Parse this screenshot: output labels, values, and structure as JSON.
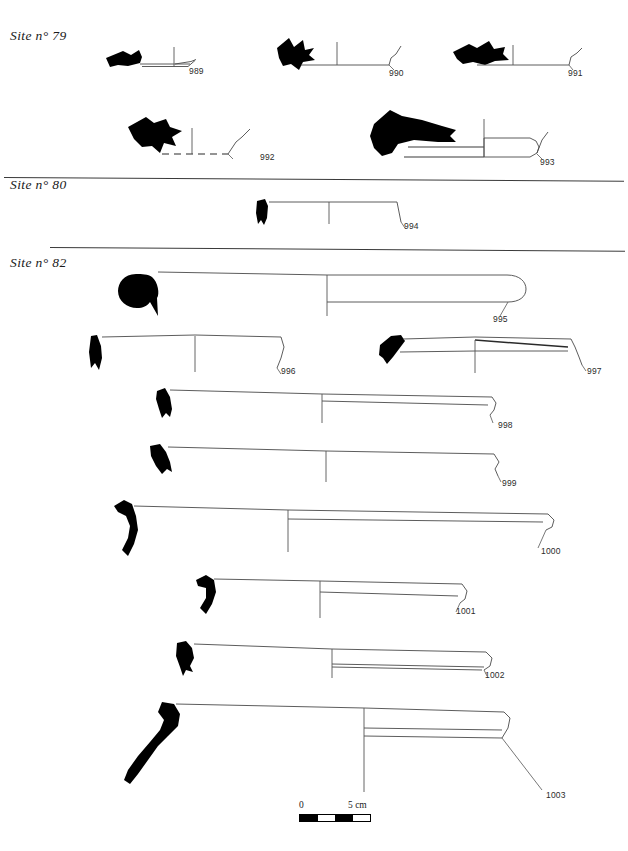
{
  "plate": {
    "type": "archaeological-pottery-plate",
    "width": 628,
    "height": 851,
    "page_header_left": "",
    "page_header_right": ""
  },
  "sections": [
    {
      "id": "site79",
      "label": "Site n° 79"
    },
    {
      "id": "site80",
      "label": "Site n° 80"
    },
    {
      "id": "site82",
      "label": "Site n° 82"
    }
  ],
  "figures": [
    {
      "number": "989",
      "site": "Site n° 79"
    },
    {
      "number": "990",
      "site": "Site n° 79"
    },
    {
      "number": "991",
      "site": "Site n° 79"
    },
    {
      "number": "992",
      "site": "Site n° 79"
    },
    {
      "number": "993",
      "site": "Site n° 79"
    },
    {
      "number": "994",
      "site": "Site n° 80"
    },
    {
      "number": "995",
      "site": "Site n° 82"
    },
    {
      "number": "996",
      "site": "Site n° 82"
    },
    {
      "number": "997",
      "site": "Site n° 82"
    },
    {
      "number": "998",
      "site": "Site n° 82"
    },
    {
      "number": "999",
      "site": "Site n° 82"
    },
    {
      "number": "1000",
      "site": "Site n° 82"
    },
    {
      "number": "1001",
      "site": "Site n° 82"
    },
    {
      "number": "1002",
      "site": "Site n° 82"
    },
    {
      "number": "1003",
      "site": "Site n° 82"
    }
  ],
  "scale": {
    "zero_label": "0",
    "max_label": "5 cm",
    "units": "cm",
    "length_cm": 5,
    "segments": 4
  },
  "colors": {
    "ink": "#000000",
    "line": "#4a4a4a",
    "paper": "#ffffff",
    "divider": "#3a3a3a"
  }
}
